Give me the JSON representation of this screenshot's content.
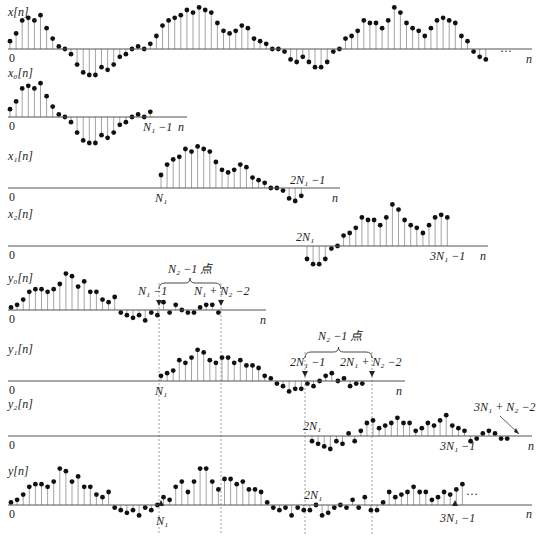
{
  "chart_data": {
    "type": "stem",
    "spacing_px": 6.1,
    "panels": [
      {
        "id": "x",
        "label": "x[n]",
        "axis_y": 49,
        "axis_x0": 8,
        "axis_x1": 532,
        "start_x": 10,
        "values": [
          3,
          6,
          11,
          12,
          11,
          13,
          8,
          4,
          1,
          0,
          -2,
          -6,
          -9,
          -10,
          -10,
          -7,
          -8,
          -6,
          -3,
          -2,
          0,
          1,
          0,
          2,
          5,
          9,
          11,
          12,
          13,
          15,
          14,
          16,
          15,
          14,
          10,
          7,
          6,
          7,
          9,
          8,
          4,
          3,
          2,
          0,
          0,
          -1,
          -4,
          -5,
          -3,
          -5,
          -7,
          -7,
          -5,
          -1,
          0,
          4,
          5,
          7,
          11,
          10,
          10,
          8,
          11,
          16,
          14,
          10,
          8,
          7,
          5,
          8,
          11,
          12,
          11,
          10,
          5,
          3,
          -1,
          -3,
          -4
        ],
        "texts": [
          {
            "t": "0",
            "x": 9,
            "y": 62
          },
          {
            "t": "···",
            "x": 500,
            "y": 55
          },
          {
            "t": "n",
            "x": 526,
            "y": 63,
            "i": true
          }
        ]
      },
      {
        "id": "x0",
        "label": "x₀[n]",
        "axis_y": 117,
        "axis_x0": 8,
        "axis_x1": 187,
        "start_x": 10,
        "values": [
          3,
          6,
          11,
          12,
          11,
          13,
          8,
          4,
          1,
          0,
          -2,
          -6,
          -9,
          -10,
          -10,
          -7,
          -8,
          -6,
          -3,
          -2,
          0,
          1,
          0,
          2
        ],
        "texts": [
          {
            "t": "0",
            "x": 9,
            "y": 130
          },
          {
            "t": "N₁ −1",
            "x": 143,
            "y": 131,
            "i": true
          },
          {
            "t": "n",
            "x": 178,
            "y": 131,
            "i": true
          }
        ]
      },
      {
        "id": "x1",
        "label": "x₁[n]",
        "axis_y": 188,
        "axis_x0": 8,
        "axis_x1": 340,
        "start_x": 161,
        "values": [
          5,
          9,
          11,
          12,
          15,
          14,
          16,
          15,
          14,
          10,
          7,
          6,
          7,
          9,
          8,
          4,
          3,
          2,
          0,
          0,
          -1,
          -4,
          -5,
          -3
        ],
        "texts": [
          {
            "t": "0",
            "x": 9,
            "y": 201
          },
          {
            "t": "N₁",
            "x": 155,
            "y": 202,
            "i": true
          },
          {
            "t": "2N₁ −1",
            "x": 290,
            "y": 184,
            "i": true
          },
          {
            "t": "n",
            "x": 332,
            "y": 202,
            "i": true
          }
        ]
      },
      {
        "id": "x2",
        "label": "x₂[n]",
        "axis_y": 246,
        "axis_x0": 8,
        "axis_x1": 488,
        "start_x": 307,
        "values": [
          -5,
          -7,
          -7,
          -5,
          -1,
          0,
          4,
          5,
          7,
          11,
          10,
          10,
          8,
          11,
          16,
          14,
          10,
          8,
          7,
          5,
          8,
          11,
          12,
          11
        ],
        "texts": [
          {
            "t": "0",
            "x": 9,
            "y": 259
          },
          {
            "t": "2N₁",
            "x": 296,
            "y": 241,
            "i": true
          },
          {
            "t": "3N₁ −1",
            "x": 430,
            "y": 260,
            "i": true
          },
          {
            "t": "n",
            "x": 480,
            "y": 260,
            "i": true
          }
        ]
      },
      {
        "id": "y0",
        "label": "y₀[n]",
        "axis_y": 310,
        "axis_x0": 8,
        "axis_x1": 266,
        "start_x": 11,
        "values": [
          1,
          2,
          4,
          7,
          8,
          8,
          7,
          8,
          10,
          14,
          13,
          9,
          11,
          7,
          7,
          4,
          3,
          5,
          -1,
          -2,
          -3,
          -2,
          -4,
          -1,
          -2,
          3,
          -1,
          2,
          0,
          -1,
          -1,
          1,
          2,
          2,
          -1
        ],
        "texts": [
          {
            "t": "0",
            "x": 9,
            "y": 323
          },
          {
            "t": "N₁ −1",
            "x": 138,
            "y": 295,
            "i": true
          },
          {
            "t": "N₁ + N₂ −2",
            "x": 194,
            "y": 295,
            "i": true
          },
          {
            "t": "N₂ −1 点",
            "x": 168,
            "y": 273,
            "i": true
          },
          {
            "t": "n",
            "x": 260,
            "y": 324,
            "i": true
          }
        ],
        "brace": {
          "x0": 159,
          "x1": 221,
          "y": 283
        },
        "markers": [
          159,
          221
        ]
      },
      {
        "id": "y1",
        "label": "y₁[n]",
        "axis_y": 381,
        "axis_x0": 8,
        "axis_x1": 405,
        "start_x": 161,
        "values": [
          2,
          3,
          4,
          8,
          7,
          9,
          12,
          11,
          8,
          7,
          9,
          9,
          7,
          8,
          6,
          6,
          5,
          2,
          1,
          -1,
          -2,
          -4,
          -3,
          -3,
          -1,
          -2,
          0,
          2,
          3,
          0,
          1,
          -2,
          -1,
          -1
        ],
        "texts": [
          {
            "t": "0",
            "x": 9,
            "y": 394
          },
          {
            "t": "N₁",
            "x": 155,
            "y": 395,
            "i": true
          },
          {
            "t": "2N₁ −1",
            "x": 290,
            "y": 366,
            "i": true
          },
          {
            "t": "2N₁ + N₂ −2",
            "x": 340,
            "y": 366,
            "i": true
          },
          {
            "t": "N₂ −1 点",
            "x": 318,
            "y": 340,
            "i": true
          },
          {
            "t": "n",
            "x": 396,
            "y": 395,
            "i": true
          }
        ],
        "brace": {
          "x0": 305,
          "x1": 372,
          "y": 352
        },
        "markers": [
          305,
          372
        ]
      },
      {
        "id": "y2",
        "label": "y₂[n]",
        "axis_y": 436,
        "axis_x0": 8,
        "axis_x1": 532,
        "start_x": 312,
        "values": [
          -2,
          -3,
          -4,
          -5,
          -2,
          -3,
          1,
          -2,
          2,
          5,
          6,
          3,
          4,
          5,
          7,
          5,
          5,
          2,
          3,
          5,
          4,
          6,
          8,
          4,
          3,
          2,
          -2,
          -1,
          1,
          2,
          1,
          -1,
          -1
        ],
        "texts": [
          {
            "t": "0",
            "x": 9,
            "y": 449
          },
          {
            "t": "2N₁",
            "x": 303,
            "y": 430,
            "i": true
          },
          {
            "t": "3N₁ −1",
            "x": 440,
            "y": 450,
            "i": true
          },
          {
            "t": "3N₁ + N₂ −2",
            "x": 474,
            "y": 411,
            "i": true
          },
          {
            "t": "n",
            "x": 528,
            "y": 450,
            "i": true
          }
        ],
        "pointer": {
          "x1": 500,
          "y1": 416,
          "x2": 519,
          "y2": 434
        }
      },
      {
        "id": "y",
        "label": "y[n]",
        "axis_y": 505,
        "axis_x0": 8,
        "axis_x1": 532,
        "start_x": 11,
        "values": [
          1,
          2,
          4,
          7,
          8,
          8,
          7,
          9,
          14,
          13,
          9,
          11,
          7,
          7,
          4,
          3,
          5,
          -1,
          -2,
          -3,
          -2,
          -4,
          -1,
          -2,
          0,
          3,
          2,
          7,
          9,
          5,
          9,
          14,
          14,
          9,
          6,
          10,
          10,
          8,
          9,
          6,
          6,
          5,
          1,
          -1,
          -2,
          -1,
          -4,
          -1,
          -2,
          -2,
          0,
          -4,
          -3,
          -1,
          0,
          -1,
          2,
          -1,
          3,
          -2,
          -2,
          1,
          5,
          3,
          4,
          5,
          7,
          5,
          5,
          2,
          3,
          5,
          4,
          6,
          8
        ],
        "texts": [
          {
            "t": "0",
            "x": 9,
            "y": 518
          },
          {
            "t": "N₁",
            "x": 156,
            "y": 525,
            "i": true
          },
          {
            "t": "2N₁",
            "x": 304,
            "y": 499,
            "i": true
          },
          {
            "t": "3N₁ −1",
            "x": 440,
            "y": 522,
            "i": true
          },
          {
            "t": "···",
            "x": 466,
            "y": 498
          },
          {
            "t": "n",
            "x": 526,
            "y": 518,
            "i": true
          }
        ],
        "up_markers": [
          161,
          455
        ]
      }
    ],
    "dashed_lines": [
      {
        "x": 159,
        "y0": 283,
        "y1": 535
      },
      {
        "x": 221,
        "y0": 283,
        "y1": 535
      },
      {
        "x": 305,
        "y0": 352,
        "y1": 535
      },
      {
        "x": 372,
        "y0": 352,
        "y1": 535
      }
    ],
    "unit_px": 2.6
  }
}
